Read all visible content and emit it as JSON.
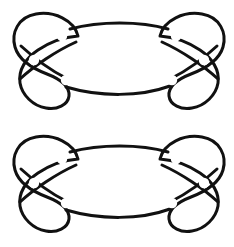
{
  "document": {
    "title": "Knot Diagram Pair",
    "type": "knot-theory-diagram",
    "background_color": "#ffffff",
    "stroke_color": "#111111",
    "width": 234,
    "height": 247
  },
  "figures": [
    {
      "id": "knot-figure-top",
      "label": "Upper knot diagram",
      "offset_y": 0,
      "stroke_width": 3.0,
      "components": {
        "lens_upper_arc": "M 70 29 C 100 21 140 21 168 29",
        "lens_lower_arc": "M 66 87 C 100 97 140 97 170 86",
        "left_outer_loop": "M 78 36 C 74 20 54 11 36 14 C 18 17 11 33 15 47 C 19 61 34 69 47 74 C 60 79 70 86 69 96 C 68 105 57 110 46 108 C 33 106 22 95 20 83 C 18 70 26 58 38 50 C 50 42 64 37 78 36 Z",
        "right_outer_loop": "M 160 36 C 164 20 184 11 202 14 C 220 17 227 33 223 47 C 219 61 204 69 191 74 C 178 79 168 86 169 96 C 170 105 181 110 192 108 C 205 106 216 95 218 83 C 220 70 212 58 200 50 C 188 42 174 37 160 36 Z",
        "left_diagonal_over": "M 20 79 C 34 66 56 51 76 42",
        "left_diagonal_lower": "M 21 46 C 34 58 50 70 66 78",
        "right_diagonal_over": "M 218 79 C 204 66 182 51 162 42",
        "right_diagonal_lower": "M 217 46 C 204 58 188 70 172 78"
      },
      "crossings": [
        {
          "name": "left-upper-crossing",
          "x": 62,
          "y": 36,
          "type": "under-gap"
        },
        {
          "name": "left-center-crossing",
          "x": 34,
          "y": 60,
          "type": "under-gap"
        },
        {
          "name": "left-lower-crossing",
          "x": 66,
          "y": 80,
          "type": "under-gap"
        },
        {
          "name": "right-upper-crossing",
          "x": 176,
          "y": 36,
          "type": "under-gap"
        },
        {
          "name": "right-center-crossing",
          "x": 204,
          "y": 60,
          "type": "under-gap"
        },
        {
          "name": "right-lower-crossing",
          "x": 172,
          "y": 80,
          "type": "under-gap"
        }
      ]
    },
    {
      "id": "knot-figure-bottom",
      "label": "Lower knot diagram",
      "offset_y": 123,
      "stroke_width": 3.0,
      "components": {
        "lens_upper_arc": "M 70 29 C 100 21 140 21 168 29",
        "lens_lower_arc": "M 66 87 C 100 97 140 97 170 86",
        "left_outer_loop": "M 78 36 C 74 20 54 11 36 14 C 18 17 11 33 15 47 C 19 61 34 69 47 74 C 60 79 70 86 69 96 C 68 105 57 110 46 108 C 33 106 22 95 20 83 C 18 70 26 58 38 50 C 50 42 64 37 78 36 Z",
        "right_outer_loop": "M 160 36 C 164 20 184 11 202 14 C 220 17 227 33 223 47 C 219 61 204 69 191 74 C 178 79 168 86 169 96 C 170 105 181 110 192 108 C 205 106 216 95 218 83 C 220 70 212 58 200 50 C 188 42 174 37 160 36 Z",
        "left_diagonal_over": "M 20 79 C 34 66 56 51 76 42",
        "left_diagonal_lower": "M 21 46 C 34 58 50 70 66 78",
        "right_diagonal_over": "M 218 79 C 204 66 182 51 162 42",
        "right_diagonal_lower": "M 217 46 C 204 58 188 70 172 78"
      },
      "crossings": [
        {
          "name": "left-upper-crossing",
          "x": 62,
          "y": 36,
          "type": "under-gap"
        },
        {
          "name": "left-center-crossing",
          "x": 34,
          "y": 60,
          "type": "under-gap"
        },
        {
          "name": "left-lower-crossing",
          "x": 66,
          "y": 80,
          "type": "under-gap"
        },
        {
          "name": "right-upper-crossing",
          "x": 176,
          "y": 36,
          "type": "under-gap"
        },
        {
          "name": "right-center-crossing",
          "x": 204,
          "y": 60,
          "type": "under-gap"
        },
        {
          "name": "right-lower-crossing",
          "x": 172,
          "y": 80,
          "type": "under-gap"
        }
      ]
    }
  ]
}
